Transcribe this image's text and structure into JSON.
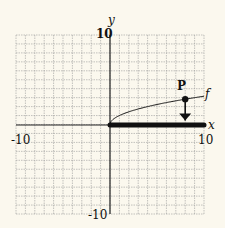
{
  "chart_data": {
    "type": "line",
    "title": "",
    "xlabel": "x",
    "ylabel": "y",
    "xlim": [
      -10,
      10
    ],
    "ylim": [
      -10,
      10
    ],
    "grid": true,
    "grid_step": 1,
    "x_tick_labels": [
      "-10",
      "10"
    ],
    "y_tick_labels": [
      "10",
      "-10"
    ],
    "series": [
      {
        "name": "f",
        "function": "sqrt(x)",
        "x": [
          0,
          1,
          2,
          3,
          4,
          5,
          6,
          7,
          8,
          9,
          10
        ],
        "values": [
          0,
          1.0,
          1.41,
          1.73,
          2.0,
          2.24,
          2.45,
          2.65,
          2.83,
          3.0,
          3.16
        ]
      }
    ],
    "highlighted_segment": {
      "name": "domain",
      "x_start": 0,
      "x_end": 10,
      "y": 0
    },
    "annotations": [
      {
        "label": "P",
        "x": 8,
        "y": 2.83,
        "arrow": "down-to-x-axis"
      },
      {
        "label": "f",
        "x": 10,
        "y": 3.3
      }
    ]
  },
  "labels": {
    "x_axis": "x",
    "y_axis": "y",
    "x_min": "-10",
    "x_max": "10",
    "y_max": "10",
    "y_min": "-10",
    "point": "P",
    "curve": "f"
  },
  "colors": {
    "background": "#fbf8ee",
    "grid": "#9a9a9a",
    "axis": "#222222",
    "ink": "#111111"
  }
}
